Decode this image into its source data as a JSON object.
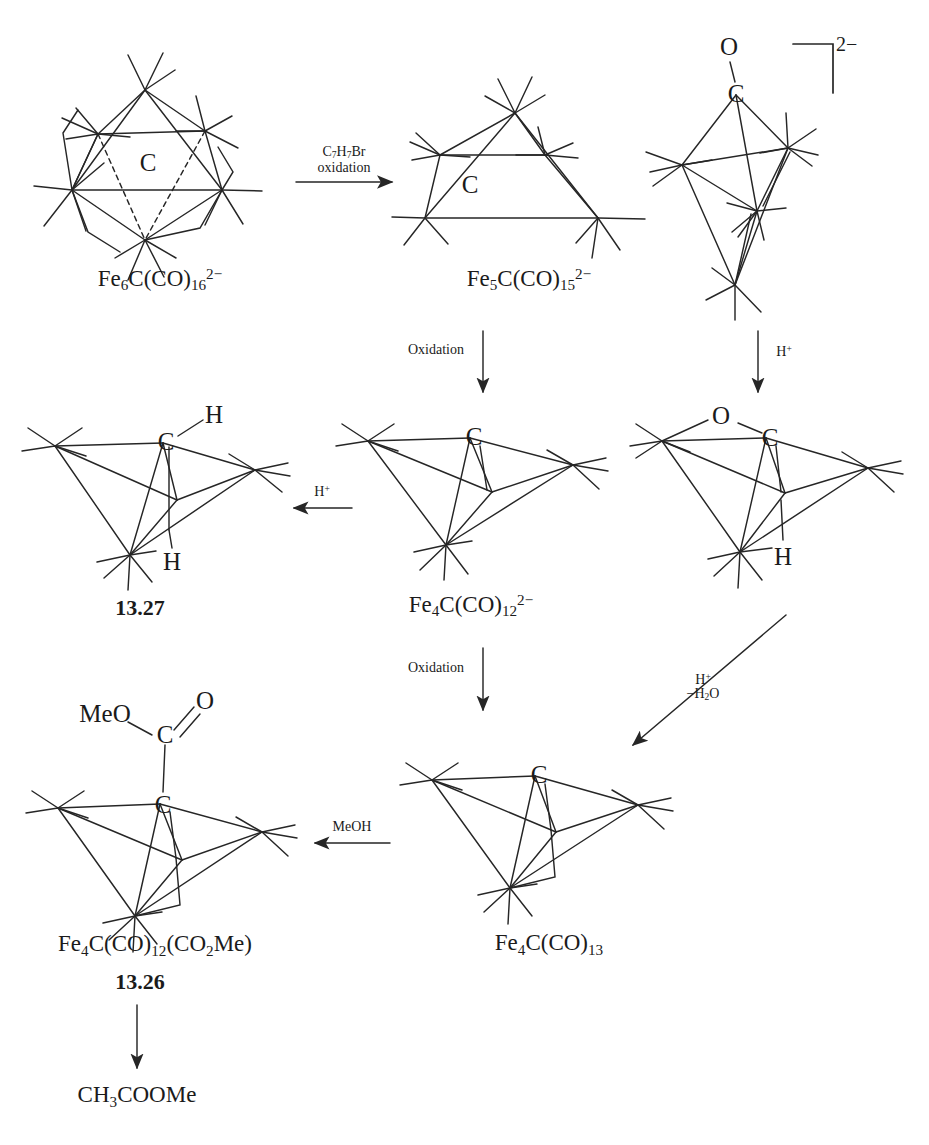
{
  "diagram": {
    "type": "chemical-reaction-scheme",
    "ink_color": "#262626",
    "background": "#ffffff"
  },
  "structures": [
    {
      "id": "fe6",
      "shape": "octahedron",
      "metal_count": 6,
      "interstitial_label": "C",
      "formula_html": "Fe<sub>6</sub>C(CO)<sub>16</sub><sup>2−</sup>",
      "charge": "2−"
    },
    {
      "id": "fe5",
      "shape": "trigonal-bipyramid",
      "metal_count": 5,
      "interstitial_label": "C",
      "formula_html": "Fe<sub>5</sub>C(CO)<sub>15</sub><sup>2−</sup>",
      "charge": "2−"
    },
    {
      "id": "fe4-co-vertical",
      "shape": "tetrahedron",
      "metal_count": 4,
      "apex_labels": [
        "O",
        "C"
      ],
      "bracket_charge": "2−",
      "formula_html": ""
    },
    {
      "id": "fe4-ch2",
      "shape": "butterfly",
      "metal_count": 4,
      "atom_labels": [
        "C",
        "H",
        "H"
      ],
      "formula_html": "",
      "compound_number": "13.27"
    },
    {
      "id": "fe4-c-dianion",
      "shape": "butterfly",
      "metal_count": 4,
      "atom_labels": [
        "C"
      ],
      "formula_html": "Fe<sub>4</sub>C(CO)<sub>12</sub><sup>2−</sup>",
      "charge": "2−"
    },
    {
      "id": "fe4-coh",
      "shape": "butterfly",
      "metal_count": 4,
      "atom_labels": [
        "O",
        "C",
        "H"
      ],
      "formula_html": ""
    },
    {
      "id": "fe4-co13",
      "shape": "butterfly",
      "metal_count": 4,
      "atom_labels": [
        "C"
      ],
      "formula_html": "Fe<sub>4</sub>C(CO)<sub>13</sub>"
    },
    {
      "id": "fe4-co2me",
      "shape": "butterfly",
      "metal_count": 4,
      "atom_labels": [
        "MeO",
        "O",
        "C",
        "C"
      ],
      "formula_html": "Fe<sub>4</sub>C(CO)<sub>12</sub>(CO<sub>2</sub>Me)",
      "compound_number": "13.26"
    }
  ],
  "atom_labels": {
    "fe6_center": "C",
    "fe5_center": "C",
    "topright_O": "O",
    "topright_C": "C",
    "c1327_C": "C",
    "c1327_H_top": "H",
    "c1327_H_bottom": "H",
    "fe4dianion_C": "C",
    "fe4coh_O": "O",
    "fe4coh_C": "C",
    "fe4coh_H": "H",
    "fe4co13_C": "C",
    "ester_MeO": "MeO",
    "ester_O": "O",
    "ester_C_upper": "C",
    "ester_C_lower": "C"
  },
  "formulas": {
    "fe6": "Fe<sub>6</sub>C(CO)<sub>16</sub><sup>2−</sup>",
    "fe5": "Fe<sub>5</sub>C(CO)<sub>15</sub><sup>2−</sup>",
    "fe4_dianion": "Fe<sub>4</sub>C(CO)<sub>12</sub><sup>2−</sup>",
    "fe4_co13": "Fe<sub>4</sub>C(CO)<sub>13</sub>",
    "fe4_co2me": "Fe<sub>4</sub>C(CO)<sub>12</sub>(CO<sub>2</sub>Me)",
    "product": "CH<sub>3</sub>COOMe"
  },
  "compound_numbers": {
    "butterfly_ch2": "13.27",
    "ester_cluster": "13.26"
  },
  "bracket": {
    "charge": "2−"
  },
  "arrows": [
    {
      "id": "arrow-1",
      "direction": "right",
      "reagent_html": "C<sub>7</sub>H<sub>7</sub>Br<br>oxidation"
    },
    {
      "id": "arrow-2",
      "direction": "down",
      "reagent_html": "Oxidation"
    },
    {
      "id": "arrow-3",
      "direction": "down",
      "reagent_html": "H<sup>+</sup>"
    },
    {
      "id": "arrow-4",
      "direction": "left",
      "reagent_html": "H<sup>+</sup>"
    },
    {
      "id": "arrow-5",
      "direction": "down",
      "reagent_html": "Oxidation"
    },
    {
      "id": "arrow-6",
      "direction": "diagonal-down-left",
      "reagent_html": "H<sup>+</sup><br>−H<sub>2</sub>O"
    },
    {
      "id": "arrow-7",
      "direction": "left",
      "reagent_html": "MeOH"
    },
    {
      "id": "arrow-8",
      "direction": "down",
      "reagent_html": ""
    }
  ],
  "reagent_labels": {
    "c7h7br_oxidation": "C<sub>7</sub>H<sub>7</sub>Br<br>oxidation",
    "oxidation_top": "Oxidation",
    "h_plus_top": "H<sup>+</sup>",
    "h_plus_left": "H<sup>+</sup>",
    "oxidation_bottom": "Oxidation",
    "h_plus_minus_water": "H<sup>+</sup><br>−H<sub>2</sub>O",
    "meoh": "MeOH"
  }
}
